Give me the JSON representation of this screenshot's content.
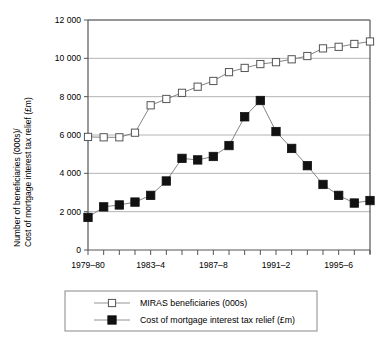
{
  "chart_data": {
    "type": "line",
    "title": "",
    "xlabel": "",
    "ylabel": "Number of beneficiaries (000s)/ Cost of mortgage interest tax relief (£m)",
    "ylabel_line1": "Number of beneficiaries (000s)/",
    "ylabel_line2": "Cost of mortgage interest tax relief (£m)",
    "ylim": [
      0,
      12000
    ],
    "ytick_values": [
      0,
      2000,
      4000,
      6000,
      8000,
      10000,
      12000
    ],
    "ytick_labels": [
      "0",
      "2 000",
      "4 000",
      "6 000",
      "8 000",
      "10 000",
      "12 000"
    ],
    "grid": true,
    "legend_position": "bottom",
    "x": [
      "1979–80",
      "1980–1",
      "1981–2",
      "1982–3",
      "1983–4",
      "1984–5",
      "1985–6",
      "1986–7",
      "1987–8",
      "1988–9",
      "1989–90",
      "1990–1",
      "1991–2",
      "1992–3",
      "1993–4",
      "1994–5",
      "1995–6",
      "1996–7",
      "1997–8"
    ],
    "xtick_labels_shown": [
      "1979–80",
      "1983–4",
      "1987–8",
      "1991–2",
      "1995–6"
    ],
    "xtick_label_indices": [
      0,
      4,
      8,
      12,
      16
    ],
    "series": [
      {
        "name": "MIRAS beneficiaries (000s)",
        "marker": "open-square",
        "marker_fill": "#ffffff",
        "marker_edge": "#555555",
        "line_color": "#777777",
        "values": [
          5900,
          5880,
          5880,
          6120,
          7550,
          7880,
          8200,
          8520,
          8820,
          9280,
          9500,
          9700,
          9800,
          9950,
          10120,
          10520,
          10600,
          10750,
          10880
        ]
      },
      {
        "name": "Cost of mortgage interest tax relief (£m)",
        "marker": "filled-square",
        "marker_fill": "#111111",
        "marker_edge": "#111111",
        "line_color": "#777777",
        "values": [
          1700,
          2250,
          2350,
          2500,
          2850,
          3600,
          4780,
          4700,
          4880,
          5450,
          6950,
          7800,
          6180,
          5300,
          4400,
          3420,
          2850,
          2450,
          2580
        ]
      }
    ]
  },
  "legend": {
    "entries": [
      {
        "label": "MIRAS beneficiaries (000s)",
        "marker": "open-square"
      },
      {
        "label": "Cost of mortgage interest tax relief (£m)",
        "marker": "filled-square"
      }
    ]
  }
}
